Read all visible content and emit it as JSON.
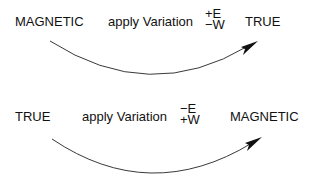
{
  "rows": [
    {
      "from": "MAGNETIC",
      "action": "apply Variation",
      "sign_top": "+E",
      "sign_bottom": "−W",
      "to": "TRUE"
    },
    {
      "from": "TRUE",
      "action": "apply Variation",
      "sign_top": "−E",
      "sign_bottom": "+W",
      "to": "MAGNETIC"
    }
  ],
  "colors": {
    "ink": "#111111",
    "background": "#ffffff"
  }
}
